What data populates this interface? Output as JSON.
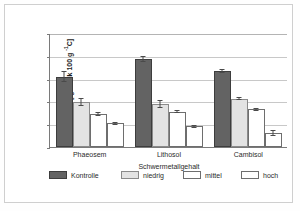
{
  "chart_data": {
    "type": "bar",
    "title": "",
    "categories": [
      "Phaeosem",
      "Lithosol",
      "Cambisol"
    ],
    "series": [
      {
        "name": "Kontrolle",
        "values": [
          1.55,
          1.95,
          1.68
        ],
        "errors": [
          0.12,
          0.06,
          0.05
        ],
        "color": "#636363"
      },
      {
        "name": "niedrig",
        "values": [
          1.0,
          0.96,
          1.07
        ],
        "errors": [
          0.09,
          0.09,
          0.04
        ],
        "color": "#e3e3e3"
      },
      {
        "name": "mittel",
        "values": [
          0.73,
          0.78,
          0.85
        ],
        "errors": [
          0.05,
          0.03,
          0.02
        ],
        "color": "#ffffff"
      },
      {
        "name": "hoch",
        "values": [
          0.54,
          0.46,
          0.31
        ],
        "errors": [
          0.02,
          0.02,
          0.06
        ],
        "color": "#ffffff"
      }
    ],
    "xlabel": "Schwermetallgehalt",
    "ylabel": "Biomasse [ g Cmik 100 g -1C]",
    "ylabel_main": "Biomasse [ g Cmik  100 g ",
    "ylabel_sup": "-1",
    "ylabel_tail": "C]",
    "yticks": [
      "0",
      "0,5",
      "1",
      "1,5",
      "2",
      "2,5"
    ],
    "ytick_values": [
      0,
      0.5,
      1,
      1.5,
      2,
      2.5
    ],
    "ylim": [
      0,
      2.5
    ],
    "grid": true,
    "legend_position": "bottom"
  },
  "legend": {
    "items": [
      {
        "label": "Kontrolle"
      },
      {
        "label": "niedrig"
      },
      {
        "label": "mittel"
      },
      {
        "label": "hoch"
      }
    ]
  }
}
